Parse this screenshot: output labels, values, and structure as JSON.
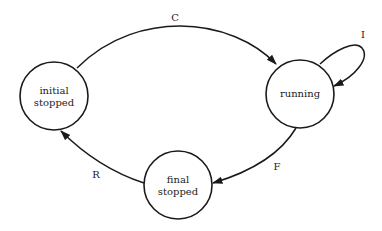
{
  "diagram": {
    "type": "state-transition",
    "states": [
      {
        "id": "initial",
        "label_line1": "initial",
        "label_line2": "stopped"
      },
      {
        "id": "running",
        "label_line1": "running",
        "label_line2": ""
      },
      {
        "id": "final",
        "label_line1": "final",
        "label_line2": "stopped"
      }
    ],
    "transitions": [
      {
        "from": "initial",
        "to": "running",
        "label": "C"
      },
      {
        "from": "running",
        "to": "running",
        "label": "I"
      },
      {
        "from": "running",
        "to": "final",
        "label": "F"
      },
      {
        "from": "final",
        "to": "initial",
        "label": "R"
      }
    ],
    "colors": {
      "stroke": "#1a1a1a",
      "background": "#ffffff",
      "text": "#222222"
    }
  }
}
